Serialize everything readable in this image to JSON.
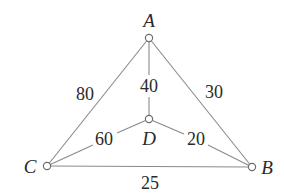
{
  "graph": {
    "nodes": [
      {
        "id": "A",
        "label": "A",
        "x": 149,
        "y": 38,
        "label_x": 149,
        "label_y": 27
      },
      {
        "id": "B",
        "label": "B",
        "x": 252,
        "y": 167,
        "label_x": 267,
        "label_y": 174
      },
      {
        "id": "C",
        "label": "C",
        "x": 47,
        "y": 166,
        "label_x": 30,
        "label_y": 173
      },
      {
        "id": "D",
        "label": "D",
        "x": 149,
        "y": 119,
        "label_x": 149,
        "label_y": 145
      }
    ],
    "edges": [
      {
        "from": "A",
        "to": "C",
        "weight": "80",
        "label_x": 85,
        "label_y": 100
      },
      {
        "from": "A",
        "to": "B",
        "weight": "30",
        "label_x": 214,
        "label_y": 98
      },
      {
        "from": "A",
        "to": "D",
        "weight": "40",
        "label_x": 149,
        "label_y": 92
      },
      {
        "from": "C",
        "to": "D",
        "weight": "60",
        "label_x": 104,
        "label_y": 145
      },
      {
        "from": "D",
        "to": "B",
        "weight": "20",
        "label_x": 196,
        "label_y": 145
      },
      {
        "from": "C",
        "to": "B",
        "weight": "25",
        "label_x": 150,
        "label_y": 189
      }
    ]
  },
  "colors": {
    "edge": "#8a8a8a",
    "node_stroke": "#6e6e6e",
    "text": "#2a2a2a",
    "background": "#ffffff"
  }
}
